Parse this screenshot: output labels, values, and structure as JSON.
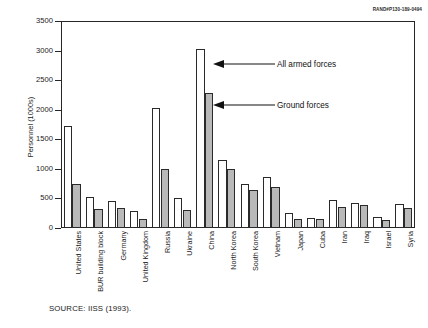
{
  "figure": {
    "rand_id": "RAND#P130-189-0494",
    "source_note": "SOURCE:  IISS (1993)."
  },
  "annotations": {
    "all_forces": "All armed forces",
    "ground_forces": "Ground forces"
  },
  "chart_data": {
    "type": "bar",
    "title": "",
    "subtitle": "",
    "xlabel": "",
    "ylabel": "Personnel (1000s)",
    "ylim": [
      0,
      3500
    ],
    "yticks": [
      0,
      500,
      1000,
      1500,
      2000,
      2500,
      3000,
      3500
    ],
    "ytick_labels": [
      "0",
      "500",
      "1000",
      "1500",
      "2000",
      "2500",
      "3000",
      "3500"
    ],
    "grid": false,
    "legend_position": "inline-annotation",
    "categories": [
      "United States",
      "BUR building block",
      "Germany",
      "United Kingdom",
      "Russia",
      "Ukraine",
      "China",
      "North Korea",
      "South Korea",
      "Vietnam",
      "Japan",
      "Cuba",
      "Iran",
      "Iraq",
      "Israel",
      "Syria"
    ],
    "series": [
      {
        "name": "All armed forces",
        "color": "#ffffff",
        "values": [
          1730,
          520,
          450,
          290,
          2030,
          500,
          3030,
          1150,
          750,
          860,
          250,
          175,
          470,
          430,
          190,
          400
        ]
      },
      {
        "name": "Ground forces",
        "color": "#b9b9b9",
        "values": [
          740,
          320,
          330,
          145,
          1000,
          300,
          2290,
          1000,
          650,
          700,
          160,
          145,
          350,
          390,
          130,
          330
        ]
      }
    ]
  }
}
